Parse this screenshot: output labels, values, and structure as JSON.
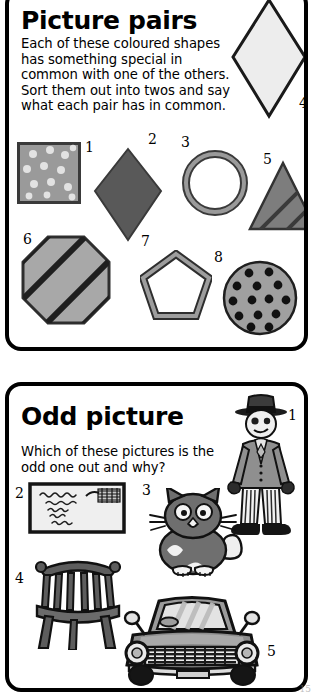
{
  "page": {
    "corner_note": "15",
    "colors": {
      "ink": "#000000",
      "paper": "#ffffff",
      "mid_gray": "#8c8c8c",
      "dark_gray": "#5a5a5a",
      "light_gray": "#d9d9d9",
      "pale_gray": "#eaeaea"
    }
  },
  "panels": [
    {
      "id": "picture-pairs",
      "title": "Picture pairs",
      "body": "Each of these coloured shapes has something special in common with one of the others. Sort them out into twos and say what each pair has in common.",
      "items": [
        {
          "number": "1",
          "name": "spotted-square",
          "description": "Grey square with pale spots"
        },
        {
          "number": "2",
          "name": "solid-diamond",
          "description": "Dark grey solid diamond"
        },
        {
          "number": "3",
          "name": "ring-circle",
          "description": "Grey circle outline / ring"
        },
        {
          "number": "4",
          "name": "outline-diamond",
          "description": "Pale diamond with dark outline"
        },
        {
          "number": "5",
          "name": "striped-triangle",
          "description": "Grey triangle with diagonal stripes"
        },
        {
          "number": "6",
          "name": "striped-octagon",
          "description": "Grey octagon with diagonal stripes"
        },
        {
          "number": "7",
          "name": "pentagon-outline",
          "description": "Grey pentagon outline"
        },
        {
          "number": "8",
          "name": "spotted-circle",
          "description": "Grey circle with black spots"
        }
      ]
    },
    {
      "id": "odd-picture",
      "title": "Odd picture",
      "body": "Which of these pictures is the odd one out and why?",
      "items": [
        {
          "number": "1",
          "name": "man-in-suit",
          "description": "Man wearing hat, suit and striped trousers"
        },
        {
          "number": "2",
          "name": "letter-envelope",
          "description": "Envelope with handwriting and postmark"
        },
        {
          "number": "3",
          "name": "cat",
          "description": "Grey sitting cat"
        },
        {
          "number": "4",
          "name": "chair",
          "description": "Wooden spindle-back chair"
        },
        {
          "number": "5",
          "name": "car",
          "description": "Car seen from the front"
        }
      ]
    }
  ]
}
